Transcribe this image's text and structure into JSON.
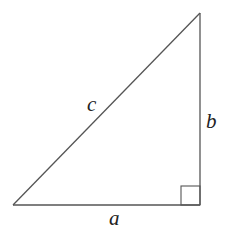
{
  "diagram": {
    "type": "right-triangle",
    "stroke_color": "#555555",
    "vertices": {
      "bottom_left": [
        13,
        205
      ],
      "bottom_right": [
        200,
        205
      ],
      "top_right": [
        200,
        13
      ]
    },
    "right_angle_marker": {
      "x": 181,
      "y": 186,
      "size": 19
    },
    "labels": {
      "hypotenuse": "c",
      "vertical_leg": "b",
      "horizontal_leg": "a"
    }
  }
}
